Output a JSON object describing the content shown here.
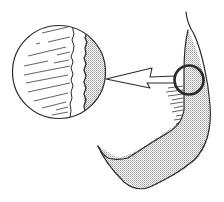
{
  "figure": {
    "elements": {
      "magnified_inset": "enlarged-view",
      "detail_circle": "region-of-interest",
      "arrow": "points-from-detail-to-inset",
      "outline": "curved-band-structure"
    },
    "colors": {
      "ink": "#2a2a2a",
      "stipple": "#9a9a9a",
      "background": "#ffffff"
    }
  }
}
